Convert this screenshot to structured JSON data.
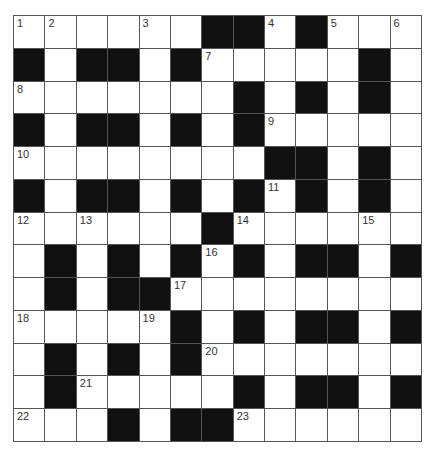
{
  "puzzle": {
    "type": "crossword",
    "rows": 13,
    "cols": 13,
    "colors": {
      "black_cell": "#111111",
      "white_cell": "#ffffff",
      "grid_line": "#555555",
      "number_text": "#333333"
    },
    "grid": [
      [
        "1",
        "2",
        ".",
        ".",
        "3",
        ".",
        "#",
        "#",
        "4",
        "#",
        "5",
        ".",
        "6"
      ],
      [
        "#",
        ".",
        "#",
        "#",
        ".",
        "#",
        "7",
        ".",
        ".",
        ".",
        ".",
        "#",
        "."
      ],
      [
        "8",
        ".",
        ".",
        ".",
        ".",
        ".",
        ".",
        "#",
        ".",
        "#",
        ".",
        "#",
        "."
      ],
      [
        "#",
        ".",
        "#",
        "#",
        ".",
        "#",
        ".",
        "#",
        "9",
        ".",
        ".",
        ".",
        "."
      ],
      [
        "10",
        ".",
        ".",
        ".",
        ".",
        ".",
        ".",
        ".",
        "#",
        "#",
        ".",
        "#",
        "."
      ],
      [
        "#",
        ".",
        "#",
        "#",
        ".",
        "#",
        ".",
        "#",
        "11",
        "#",
        ".",
        "#",
        "."
      ],
      [
        "12",
        ".",
        "13",
        ".",
        ".",
        ".",
        "#",
        "14",
        ".",
        ".",
        ".",
        "15",
        "."
      ],
      [
        ".",
        "#",
        ".",
        "#",
        ".",
        "#",
        "16",
        "#",
        ".",
        "#",
        "#",
        ".",
        "#"
      ],
      [
        ".",
        "#",
        ".",
        "#",
        "#",
        "17",
        ".",
        ".",
        ".",
        ".",
        ".",
        ".",
        "."
      ],
      [
        "18",
        ".",
        ".",
        ".",
        "19",
        "#",
        ".",
        "#",
        ".",
        "#",
        "#",
        ".",
        "#"
      ],
      [
        ".",
        "#",
        ".",
        "#",
        ".",
        "#",
        "20",
        ".",
        ".",
        ".",
        ".",
        ".",
        "."
      ],
      [
        ".",
        "#",
        "21",
        ".",
        ".",
        ".",
        ".",
        "#",
        ".",
        "#",
        "#",
        ".",
        "#"
      ],
      [
        "22",
        ".",
        ".",
        "#",
        ".",
        "#",
        "#",
        "23",
        ".",
        ".",
        ".",
        ".",
        "."
      ]
    ],
    "legend": {
      "#": "black cell",
      ".": "empty white cell",
      "number": "white cell with clue number"
    }
  }
}
